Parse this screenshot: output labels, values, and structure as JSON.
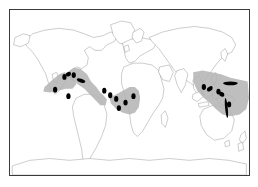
{
  "figure": {
    "kind": "world-distribution-map",
    "projection": "equirectangular",
    "background_color": "#ffffff",
    "frame_color": "#3a3a3a",
    "has_visible_text": false,
    "caption": "",
    "title": ""
  },
  "map": {
    "coastline_color": "#8a8a8a",
    "coastline_width": 0.5,
    "land_fill": "#ffffff",
    "lon_range": [
      -180,
      180
    ],
    "lat_range": [
      -90,
      90
    ]
  },
  "legend": {
    "visible": false,
    "entries": [
      {
        "symbol": "shaded-area",
        "color": "#b3b3b3",
        "label": ""
      },
      {
        "symbol": "filled-circle",
        "color": "#000000",
        "label": ""
      },
      {
        "symbol": "filled-patch",
        "color": "#000000",
        "label": ""
      }
    ]
  },
  "chart_data": {
    "type": "map",
    "title": "",
    "xlabel": "",
    "ylabel": "",
    "xlim": [
      -180,
      180
    ],
    "ylim": [
      -90,
      90
    ],
    "grid": false,
    "legend_position": "none",
    "shaded_range_color": "#b3b3b3",
    "point_color": "#000000",
    "patch_color": "#000000",
    "shaded_ranges": [
      {
        "name": "eastern-pacific-central-america",
        "polygon_lonlat": [
          [
            -128,
            6
          ],
          [
            -116,
            14
          ],
          [
            -106,
            20
          ],
          [
            -98,
            22
          ],
          [
            -90,
            20
          ],
          [
            -84,
            14
          ],
          [
            -80,
            9
          ],
          [
            -86,
            4
          ],
          [
            -96,
            4
          ],
          [
            -108,
            2
          ],
          [
            -120,
            0
          ],
          [
            -130,
            1
          ]
        ]
      },
      {
        "name": "western-atlantic-caribbean",
        "polygon_lonlat": [
          [
            -92,
            23
          ],
          [
            -84,
            27
          ],
          [
            -74,
            26
          ],
          [
            -64,
            20
          ],
          [
            -58,
            12
          ],
          [
            -50,
            6
          ],
          [
            -44,
            0
          ],
          [
            -38,
            -4
          ],
          [
            -34,
            -8
          ],
          [
            -36,
            -14
          ],
          [
            -44,
            -14
          ],
          [
            -52,
            -8
          ],
          [
            -60,
            -2
          ],
          [
            -68,
            4
          ],
          [
            -78,
            9
          ],
          [
            -86,
            13
          ],
          [
            -92,
            18
          ]
        ]
      },
      {
        "name": "eastern-atlantic-west-africa",
        "polygon_lonlat": [
          [
            -30,
            -6
          ],
          [
            -20,
            -2
          ],
          [
            -10,
            2
          ],
          [
            0,
            6
          ],
          [
            8,
            6
          ],
          [
            14,
            2
          ],
          [
            16,
            -6
          ],
          [
            14,
            -16
          ],
          [
            8,
            -22
          ],
          [
            0,
            -24
          ],
          [
            -10,
            -22
          ],
          [
            -20,
            -18
          ],
          [
            -28,
            -12
          ]
        ]
      },
      {
        "name": "indo-west-pacific",
        "polygon_lonlat": [
          [
            96,
            22
          ],
          [
            110,
            24
          ],
          [
            124,
            22
          ],
          [
            138,
            20
          ],
          [
            152,
            16
          ],
          [
            166,
            14
          ],
          [
            178,
            12
          ],
          [
            180,
            -6
          ],
          [
            176,
            -18
          ],
          [
            166,
            -24
          ],
          [
            152,
            -26
          ],
          [
            140,
            -24
          ],
          [
            130,
            -18
          ],
          [
            122,
            -12
          ],
          [
            112,
            -6
          ],
          [
            102,
            2
          ],
          [
            96,
            12
          ]
        ]
      }
    ],
    "point_localities": [
      {
        "id": 1,
        "lonlat": [
          -112,
          3
        ],
        "region": "eastern-pacific"
      },
      {
        "id": 2,
        "lonlat": [
          -92,
          -4
        ],
        "region": "eastern-pacific"
      },
      {
        "id": 3,
        "lonlat": [
          -98,
          17
        ],
        "region": "gulf-of-california"
      },
      {
        "id": 4,
        "lonlat": [
          -84,
          19
        ],
        "region": "central-america"
      },
      {
        "id": 5,
        "lonlat": [
          -38,
          2
        ],
        "region": "equatorial-atlantic"
      },
      {
        "id": 6,
        "lonlat": [
          -29,
          -3
        ],
        "region": "equatorial-atlantic"
      },
      {
        "id": 7,
        "lonlat": [
          -20,
          -7
        ],
        "region": "mid-atlantic"
      },
      {
        "id": 8,
        "lonlat": [
          -16,
          -17
        ],
        "region": "south-atlantic"
      },
      {
        "id": 9,
        "lonlat": [
          -6,
          -11
        ],
        "region": "gulf-of-guinea"
      },
      {
        "id": 10,
        "lonlat": [
          6,
          -4
        ],
        "region": "gulf-of-guinea"
      },
      {
        "id": 11,
        "lonlat": [
          112,
          6
        ],
        "region": "indonesia"
      },
      {
        "id": 12,
        "lonlat": [
          134,
          1
        ],
        "region": "new-guinea"
      },
      {
        "id": 13,
        "lonlat": [
          150,
          -13
        ],
        "region": "coral-sea"
      }
    ],
    "filled_patches": [
      {
        "id": "p1",
        "name": "sulawesi-patch",
        "lonlat": [
          121,
          4
        ],
        "w_deg": 9,
        "h_deg": 5,
        "rot_deg": -20
      },
      {
        "id": "p2",
        "name": "north-pacific-bar",
        "lonlat": [
          152,
          10
        ],
        "w_deg": 22,
        "h_deg": 4,
        "rot_deg": 0
      },
      {
        "id": "p3",
        "name": "new-guinea-patch",
        "lonlat": [
          139,
          -2
        ],
        "w_deg": 8,
        "h_deg": 5,
        "rot_deg": 15
      },
      {
        "id": "p4",
        "name": "great-barrier-bar",
        "lonlat": [
          146,
          -17
        ],
        "w_deg": 4,
        "h_deg": 22,
        "rot_deg": -8
      },
      {
        "id": "p5",
        "name": "caribbean-bar",
        "lonlat": [
          -73,
          13
        ],
        "w_deg": 13,
        "h_deg": 4,
        "rot_deg": 12
      },
      {
        "id": "p6",
        "name": "gulf-mexico-patch",
        "lonlat": [
          -92,
          20
        ],
        "w_deg": 8,
        "h_deg": 5,
        "rot_deg": -10
      }
    ]
  }
}
